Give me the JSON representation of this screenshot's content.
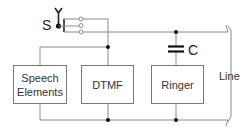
{
  "diagram": {
    "type": "telephone circuit block diagram",
    "switch": {
      "label": "S",
      "contacts": 3
    },
    "capacitor": {
      "label": "C"
    },
    "blocks": [
      {
        "id": "speech",
        "label_line1": "Speech",
        "label_line2": "Elements"
      },
      {
        "id": "dtmf",
        "label": "DTMF"
      },
      {
        "id": "ringer",
        "label": "Ringer"
      }
    ],
    "line_label": "Line",
    "colors": {
      "wire": "#8a8a8a",
      "junction": "#111111",
      "text": "#333333"
    }
  }
}
